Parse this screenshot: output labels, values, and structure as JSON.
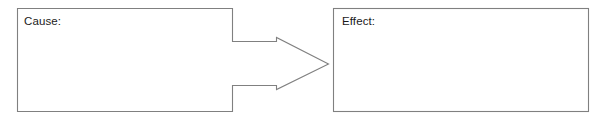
{
  "diagram": {
    "type": "cause-and-effect-graphic-organizer",
    "background_color": "#ffffff",
    "line_color": "#808080",
    "text_color": "#1a1a1a",
    "cause": {
      "label": "Cause:",
      "content": ""
    },
    "effect": {
      "label": "Effect:",
      "content": ""
    },
    "connector": {
      "icon_name": "right-block-arrow-icon",
      "direction": "right"
    }
  }
}
